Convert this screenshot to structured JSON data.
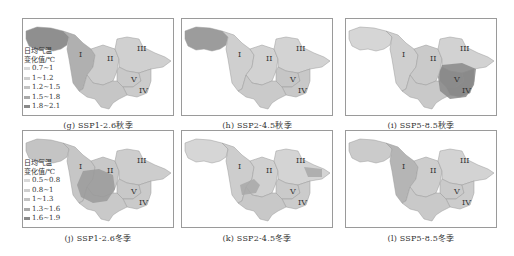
{
  "figure": {
    "region_labels": [
      "I",
      "II",
      "III",
      "IV",
      "V"
    ],
    "legend_title_line1": "日均气温",
    "legend_title_line2": "变化值/℃",
    "colors": {
      "c1": "#d9d9d9",
      "c2": "#cfcfcf",
      "c3": "#c3c3c3",
      "c4": "#a9a9a9",
      "c5": "#8a8a8a"
    }
  },
  "legends": {
    "autumn": {
      "title1": "日均气温",
      "title2": "变化值/℃",
      "items": [
        {
          "label": "0.7~1",
          "color": "#d9d9d9"
        },
        {
          "label": "1~1.2",
          "color": "#cfcfcf"
        },
        {
          "label": "1.2~1.5",
          "color": "#c3c3c3"
        },
        {
          "label": "1.5~1.8",
          "color": "#a9a9a9"
        },
        {
          "label": "1.8~2.1",
          "color": "#8a8a8a"
        }
      ]
    },
    "winter": {
      "title1": "日均气温",
      "title2": "变化值/℃",
      "items": [
        {
          "label": "0.5~0.8",
          "color": "#d9d9d9"
        },
        {
          "label": "0.8~1",
          "color": "#cfcfcf"
        },
        {
          "label": "1~1.3",
          "color": "#c3c3c3"
        },
        {
          "label": "1.3~1.6",
          "color": "#a9a9a9"
        },
        {
          "label": "1.6~1.9",
          "color": "#8a8a8a"
        }
      ]
    }
  },
  "panels": [
    {
      "id": "g",
      "caption": "(g) SSP1-2.6秋季",
      "scenario": "SSP1-2.6",
      "season": "秋季",
      "fills": {
        "west": "#8f8f8f",
        "I": "#b0b0b0",
        "II": "#cdcdcd",
        "III": "#d0d0d0",
        "IV": "#cbcbcb",
        "V": "#c9c9c9",
        "south": "#c6c6c6",
        "hot": "none"
      }
    },
    {
      "id": "h",
      "caption": "(h) SSP2-4.5秋季",
      "scenario": "SSP2-4.5",
      "season": "秋季",
      "fills": {
        "west": "#9c9c9c",
        "I": "#cfcfcf",
        "II": "#d2d2d2",
        "III": "#d3d3d3",
        "IV": "#c8c8c8",
        "V": "#c6c6c6",
        "south": "#cacaca",
        "hot": "none"
      }
    },
    {
      "id": "i",
      "caption": "(i) SSP5-8.5秋季",
      "scenario": "SSP5-8.5",
      "season": "秋季",
      "fills": {
        "west": "#d6d6d6",
        "I": "#cfcfcf",
        "II": "#cacaca",
        "III": "#d2d2d2",
        "IV": "#8e8e8e",
        "V": "#929292",
        "south": "#c9c9c9",
        "hot": "#8a8a8a"
      }
    },
    {
      "id": "j",
      "caption": "(j) SSP1-2.6冬季",
      "scenario": "SSP1-2.6",
      "season": "冬季",
      "fills": {
        "west": "#c4c4c4",
        "I": "#c6c6c6",
        "II": "#c8c8c8",
        "III": "#cdcdcd",
        "IV": "#cacaca",
        "V": "#c8c8c8",
        "south": "#c9c9c9",
        "hot": "#9a9a9a"
      }
    },
    {
      "id": "k",
      "caption": "(k) SSP2-4.5冬季",
      "scenario": "SSP2-4.5",
      "season": "冬季",
      "fills": {
        "west": "#d6d6d6",
        "I": "#cdcdcd",
        "II": "#d0d0d0",
        "III": "#d4d4d4",
        "IV": "#cbcbcb",
        "V": "#cacaca",
        "south": "#c8c8c8",
        "hot": "#a8a8a8"
      }
    },
    {
      "id": "l",
      "caption": "(l) SSP5-8.5冬季",
      "scenario": "SSP5-8.5",
      "season": "冬季",
      "fills": {
        "west": "#cbcbcb",
        "I": "#b5b5b5",
        "II": "#cdcdcd",
        "III": "#d3d3d3",
        "IV": "#cccccc",
        "V": "#cacaca",
        "south": "#c9c9c9",
        "hot": "none"
      }
    }
  ]
}
